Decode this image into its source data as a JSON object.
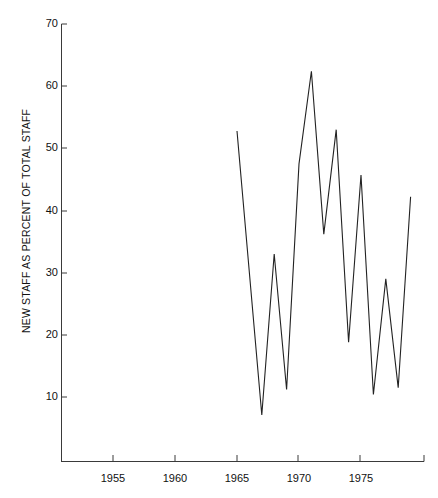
{
  "chart_data": {
    "type": "line",
    "title": "",
    "subtitle": "",
    "xlabel": "",
    "ylabel": "NEW STAFF AS PERCENT OF TOTAL STAFF",
    "xlim": [
      1951.5,
      1979.5
    ],
    "ylim": [
      2.0,
      70.0
    ],
    "grid": false,
    "legend": null,
    "x_ticks": [
      1955,
      1960,
      1965,
      1970,
      1975
    ],
    "x_tick_labels": [
      "1955",
      "1960",
      "1965",
      "1970",
      "1975"
    ],
    "y_ticks": [
      10,
      20,
      30,
      40,
      50,
      60,
      70
    ],
    "y_tick_labels": [
      "10",
      "20",
      "30",
      "40",
      "50",
      "60",
      "70"
    ],
    "series": [
      {
        "name": "New staff as percent of total staff",
        "color": "#222222",
        "x": [
          1965,
          1967,
          1968,
          1969,
          1970,
          1971,
          1972,
          1973,
          1974,
          1975,
          1976,
          1977,
          1978,
          1979
        ],
        "values": [
          52.8,
          7.1,
          33.0,
          11.2,
          47.5,
          62.4,
          36.2,
          53.0,
          18.8,
          45.7,
          10.4,
          29.0,
          11.5,
          42.2
        ]
      }
    ]
  },
  "axes": {
    "y_axis_title": "NEW STAFF AS PERCENT OF TOTAL STAFF"
  },
  "footer": {
    "artifact_text": ""
  }
}
